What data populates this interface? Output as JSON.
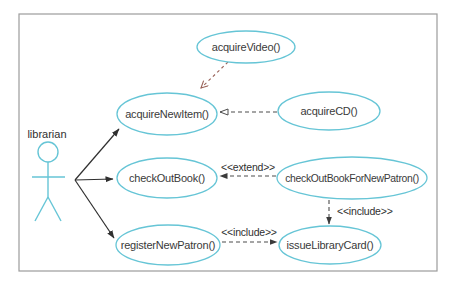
{
  "diagram": {
    "kind": "uml-use-case-diagram",
    "actor": {
      "label": "librarian"
    },
    "use_cases": {
      "acquireVideo": {
        "label": "acquireVideo()"
      },
      "acquireNewItem": {
        "label": "acquireNewItem()"
      },
      "acquireCD": {
        "label": "acquireCD()"
      },
      "checkOutBook": {
        "label": "checkOutBook()"
      },
      "checkOutBookForNewPatron": {
        "label": "checkOutBookForNewPatron()"
      },
      "registerNewPatron": {
        "label": "registerNewPatron()"
      },
      "issueLibraryCard": {
        "label": "issueLibraryCard()"
      }
    },
    "stereotype_labels": {
      "extend": "<<extend>>",
      "include_vertical": "<<include>>",
      "include_horizontal": "<<include>>"
    },
    "relationships": [
      {
        "from": "librarian",
        "to": "acquireNewItem",
        "type": "association",
        "arrowhead": "filled"
      },
      {
        "from": "librarian",
        "to": "checkOutBook",
        "type": "association",
        "arrowhead": "filled"
      },
      {
        "from": "librarian",
        "to": "registerNewPatron",
        "type": "association",
        "arrowhead": "filled"
      },
      {
        "from": "acquireVideo",
        "to": "acquireNewItem",
        "type": "dependency",
        "arrowhead": "open-v",
        "line": "dashed"
      },
      {
        "from": "acquireCD",
        "to": "acquireNewItem",
        "type": "dependency",
        "arrowhead": "open-triangle",
        "line": "dashed"
      },
      {
        "from": "checkOutBookForNewPatron",
        "to": "checkOutBook",
        "type": "extend",
        "label": "<<extend>>",
        "line": "dashed"
      },
      {
        "from": "checkOutBookForNewPatron",
        "to": "issueLibraryCard",
        "type": "include",
        "label": "<<include>>",
        "line": "dashed"
      },
      {
        "from": "registerNewPatron",
        "to": "issueLibraryCard",
        "type": "include",
        "label": "<<include>>",
        "line": "dashed"
      }
    ],
    "colors": {
      "shape_stroke": "#66c5d6",
      "text": "#3a3a3a",
      "solid_line": "#2f2f2f",
      "dashed_line": "#4d4d4d",
      "video_dashed_line": "#996258",
      "frame_border": "#9c9c9c",
      "background": "#ffffff"
    }
  }
}
